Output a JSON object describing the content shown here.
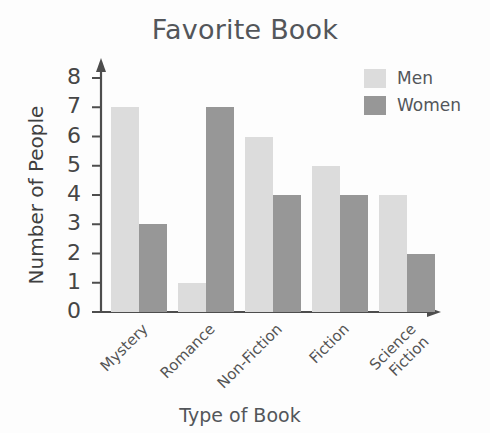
{
  "chart_data": {
    "type": "bar",
    "title": "Favorite Book",
    "xlabel": "Type of Book",
    "ylabel": "Number of People",
    "categories": [
      "Mystery",
      "Romance",
      "Non-Fiction",
      "Fiction",
      "Science Fiction"
    ],
    "series": [
      {
        "name": "Men",
        "color": "#dcdcdc",
        "values": [
          7,
          1,
          6,
          5,
          4
        ]
      },
      {
        "name": "Women",
        "color": "#979797",
        "values": [
          3,
          7,
          4,
          4,
          2
        ]
      }
    ],
    "ylim": [
      0,
      8
    ],
    "yticks": [
      0,
      1,
      2,
      3,
      4,
      5,
      6,
      7,
      8
    ],
    "ytick_labels": [
      "0",
      "1",
      "2",
      "3",
      "4",
      "5",
      "6",
      "7",
      "8"
    ],
    "grid": false,
    "legend_position": "top-right",
    "axis_style": "arrow-ended"
  },
  "title": "Favorite Book",
  "axes": {
    "y_title": "Number of People",
    "x_title": "Type of Book",
    "y_ticks": [
      "8",
      "7",
      "6",
      "5",
      "4",
      "3",
      "2",
      "1",
      "0"
    ]
  },
  "legend": {
    "items": [
      {
        "label": "Men",
        "color": "#dcdcdc"
      },
      {
        "label": "Women",
        "color": "#979797"
      }
    ]
  },
  "x_labels": [
    {
      "line1": "Mystery",
      "line2": ""
    },
    {
      "line1": "Romance",
      "line2": ""
    },
    {
      "line1": "Non-Fiction",
      "line2": ""
    },
    {
      "line1": "Fiction",
      "line2": ""
    },
    {
      "line1": "Science",
      "line2": "Fiction"
    }
  ]
}
